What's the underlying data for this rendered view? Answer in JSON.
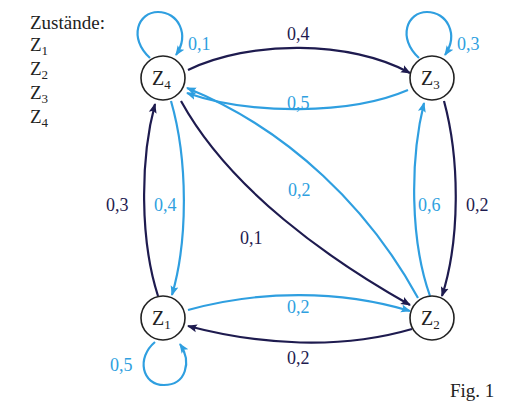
{
  "legend": {
    "title": "Zustände:",
    "states": [
      {
        "base": "Z",
        "sub": "1"
      },
      {
        "base": "Z",
        "sub": "2"
      },
      {
        "base": "Z",
        "sub": "3"
      },
      {
        "base": "Z",
        "sub": "4"
      }
    ]
  },
  "colors": {
    "dark_edge": "#1e1b4f",
    "light_edge": "#2f9fe0",
    "node_stroke": "#222222"
  },
  "nodes": [
    {
      "id": "Z1",
      "base": "Z",
      "sub": "1"
    },
    {
      "id": "Z2",
      "base": "Z",
      "sub": "2"
    },
    {
      "id": "Z3",
      "base": "Z",
      "sub": "3"
    },
    {
      "id": "Z4",
      "base": "Z",
      "sub": "4"
    }
  ],
  "edges": [
    {
      "from": "Z4",
      "to": "Z4",
      "label": "0,1",
      "color": "light"
    },
    {
      "from": "Z3",
      "to": "Z3",
      "label": "0,3",
      "color": "light"
    },
    {
      "from": "Z1",
      "to": "Z1",
      "label": "0,5",
      "color": "light"
    },
    {
      "from": "Z4",
      "to": "Z3",
      "label": "0,4",
      "color": "dark"
    },
    {
      "from": "Z3",
      "to": "Z4",
      "label": "0,5",
      "color": "light"
    },
    {
      "from": "Z1",
      "to": "Z4",
      "label": "0,3",
      "color": "dark"
    },
    {
      "from": "Z4",
      "to": "Z1",
      "label": "0,4",
      "color": "light"
    },
    {
      "from": "Z4",
      "to": "Z2",
      "label": "0,1",
      "color": "dark"
    },
    {
      "from": "Z2",
      "to": "Z4",
      "label": "0,2",
      "color": "light"
    },
    {
      "from": "Z2",
      "to": "Z3",
      "label": "0,6",
      "color": "light"
    },
    {
      "from": "Z3",
      "to": "Z2",
      "label": "0,2",
      "color": "dark"
    },
    {
      "from": "Z1",
      "to": "Z2",
      "label": "0,2",
      "color": "light"
    },
    {
      "from": "Z2",
      "to": "Z1",
      "label": "0,2",
      "color": "dark"
    }
  ],
  "figure_label": "Fig. 1"
}
